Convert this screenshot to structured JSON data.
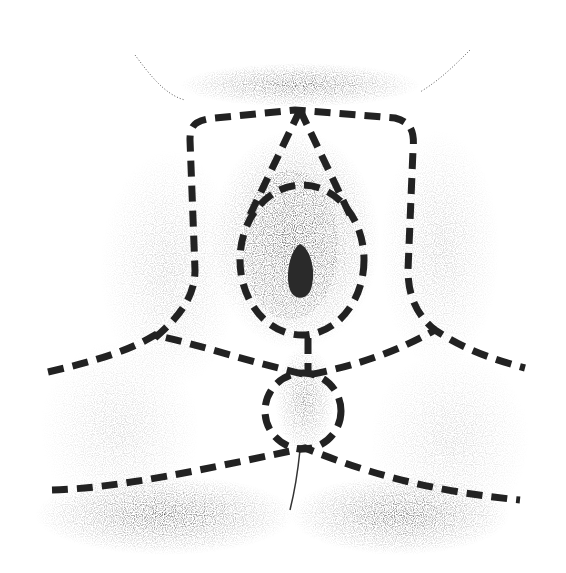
{
  "figure": {
    "type": "anatomical-region-diagram",
    "style": "stippled line drawing with dashed region boundaries",
    "background": "#ffffff",
    "ink_color": "#222222",
    "regions": [
      {
        "id": "upper-trapezoid",
        "shape": "rounded rectangle boundary around upper area"
      },
      {
        "id": "central-oval",
        "shape": "oval boundary around central area"
      },
      {
        "id": "apex-triangle",
        "shape": "triangular boundary lines from top center"
      },
      {
        "id": "lower-circle",
        "shape": "small circle boundary in lower center"
      },
      {
        "id": "upper-transverse-line",
        "shape": "dashed line across middle"
      },
      {
        "id": "lower-transverse-line",
        "shape": "dashed line across lower area"
      }
    ]
  }
}
